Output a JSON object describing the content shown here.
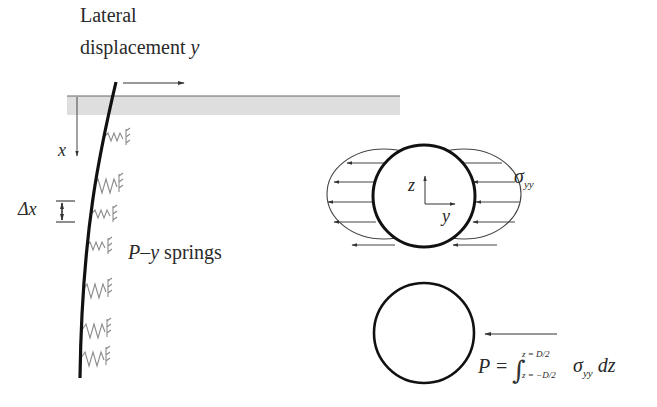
{
  "labels": {
    "lateral_line1": "Lateral",
    "lateral_line2": "displacement",
    "lateral_var": "y",
    "depth_var": "x",
    "delta_x": "Δx",
    "springs_var": "P–y",
    "springs_text": "springs",
    "axis_z": "z",
    "axis_y": "y",
    "sigma": "σ",
    "sigma_sub": "yy",
    "formula_lhs": "P =",
    "formula_upper": "z = D/2",
    "formula_lower": "z = −D/2",
    "formula_integrand": "σ",
    "formula_integrand_sub": "yy",
    "formula_dz": "dz"
  },
  "colors": {
    "pile": "#111111",
    "ground": "#dcdcdc",
    "spring": "#8a8a8a",
    "lines": "#333333"
  },
  "springs_y": [
    137,
    185,
    214,
    246,
    290,
    330,
    355
  ]
}
